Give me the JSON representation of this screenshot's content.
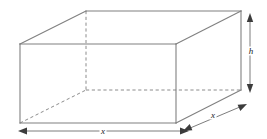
{
  "figure": {
    "shape_name": "rectangular-prism",
    "colors": {
      "solid_edge": "#808080",
      "hidden_edge": "#8c8c8c",
      "dimension_line": "#6e6e6e",
      "arrowhead": "#3c3c3c",
      "label_text": "#1a1a1a",
      "background": "#ffffff"
    }
  },
  "labels": {
    "width": "x",
    "depth": "x",
    "height": "h"
  },
  "dimensions": [
    {
      "name": "width",
      "label": "x",
      "orientation": "horizontal",
      "position": "bottom-front"
    },
    {
      "name": "depth",
      "label": "x",
      "orientation": "diagonal",
      "position": "bottom-right"
    },
    {
      "name": "height",
      "label": "h",
      "orientation": "vertical",
      "position": "right-side"
    }
  ],
  "geometry": {
    "front_face": {
      "tl": [
        20,
        44
      ],
      "tr": [
        176,
        44
      ],
      "br": [
        176,
        123
      ],
      "bl": [
        20,
        123
      ]
    },
    "back_face": {
      "tl": [
        86,
        11
      ],
      "tr": [
        241,
        11
      ],
      "br": [
        241,
        90
      ],
      "bl": [
        86,
        90
      ]
    },
    "hidden_edges": [
      {
        "name": "back-left-vertical",
        "from": [
          86,
          11
        ],
        "to": [
          86,
          90
        ]
      },
      {
        "name": "back-bottom",
        "from": [
          86,
          90
        ],
        "to": [
          241,
          90
        ]
      },
      {
        "name": "bottom-left-depth",
        "from": [
          20,
          123
        ],
        "to": [
          86,
          90
        ]
      }
    ]
  }
}
